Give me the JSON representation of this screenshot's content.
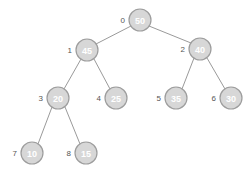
{
  "diagram": {
    "background_color": "#ffffff",
    "node_fill_color": "#d7d7d7",
    "node_stroke_color": "#9d9d9d",
    "node_value_color": "#ffffff",
    "node_index_color": "#555555",
    "edge_color": "#9a9a9a",
    "node_radius": 11
  },
  "nodes": [
    {
      "index": "0",
      "value": "50",
      "cx": 140,
      "cy": 20,
      "index_x": 125,
      "index_y": 20
    },
    {
      "index": "1",
      "value": "45",
      "cx": 87,
      "cy": 50,
      "index_x": 72,
      "index_y": 50
    },
    {
      "index": "2",
      "value": "40",
      "cx": 200,
      "cy": 49,
      "index_x": 185,
      "index_y": 49
    },
    {
      "index": "3",
      "value": "20",
      "cx": 58,
      "cy": 98,
      "index_x": 43,
      "index_y": 98
    },
    {
      "index": "4",
      "value": "25",
      "cx": 116,
      "cy": 98,
      "index_x": 101,
      "index_y": 98
    },
    {
      "index": "5",
      "value": "35",
      "cx": 176,
      "cy": 98,
      "index_x": 161,
      "index_y": 98
    },
    {
      "index": "6",
      "value": "30",
      "cx": 231,
      "cy": 98,
      "index_x": 216,
      "index_y": 98
    },
    {
      "index": "7",
      "value": "10",
      "cx": 32,
      "cy": 153,
      "index_x": 17,
      "index_y": 153
    },
    {
      "index": "8",
      "value": "15",
      "cx": 86,
      "cy": 153,
      "index_x": 71,
      "index_y": 153
    }
  ],
  "edges": [
    {
      "from": "0",
      "to": "1",
      "x1": 131,
      "y1": 26,
      "x2": 96,
      "y2": 44
    },
    {
      "from": "0",
      "to": "2",
      "x1": 149,
      "y1": 26,
      "x2": 191,
      "y2": 43
    },
    {
      "from": "1",
      "to": "3",
      "x1": 81,
      "y1": 59,
      "x2": 64,
      "y2": 89
    },
    {
      "from": "1",
      "to": "4",
      "x1": 94,
      "y1": 59,
      "x2": 110,
      "y2": 89
    },
    {
      "from": "2",
      "to": "5",
      "x1": 194,
      "y1": 58,
      "x2": 182,
      "y2": 89
    },
    {
      "from": "2",
      "to": "6",
      "x1": 207,
      "y1": 58,
      "x2": 225,
      "y2": 89
    },
    {
      "from": "3",
      "to": "7",
      "x1": 52,
      "y1": 107,
      "x2": 38,
      "y2": 144
    },
    {
      "from": "3",
      "to": "8",
      "x1": 65,
      "y1": 107,
      "x2": 80,
      "y2": 144
    }
  ]
}
